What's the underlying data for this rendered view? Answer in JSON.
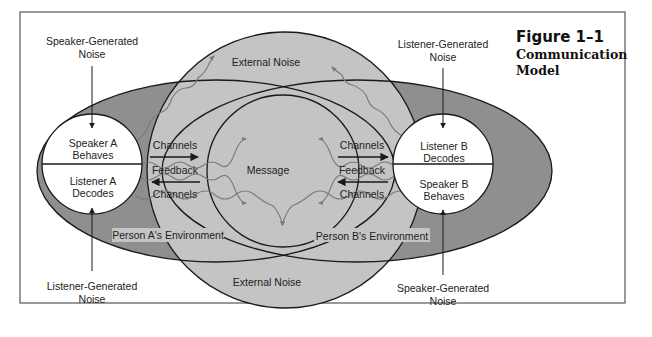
{
  "figure": {
    "number": "Figure 1–1",
    "title_line1": "Communication",
    "title_line2": "Model"
  },
  "colors": {
    "background": "#ffffff",
    "frame": "#555555",
    "environment_fill": "#8f8f8f",
    "external_noise_fill": "#c4c4c4",
    "person_circle_fill": "#ffffff",
    "stroke": "#1a1a1a",
    "wave": "#7a7a7a"
  },
  "noise_sources": {
    "top_left": {
      "line1": "Speaker-Generated",
      "line2": "Noise"
    },
    "top_right": {
      "line1": "Listener-Generated",
      "line2": "Noise"
    },
    "bottom_left": {
      "line1": "Listener-Generated",
      "line2": "Noise"
    },
    "bottom_right": {
      "line1": "Speaker-Generated",
      "line2": "Noise"
    }
  },
  "person_a": {
    "top": {
      "line1": "Speaker A",
      "line2": "Behaves"
    },
    "bottom": {
      "line1": "Listener A",
      "line2": "Decodes"
    },
    "environment": "Person A's Environment"
  },
  "person_b": {
    "top": {
      "line1": "Listener B",
      "line2": "Decodes"
    },
    "bottom": {
      "line1": "Speaker B",
      "line2": "Behaves"
    },
    "environment": "Person B's Environment"
  },
  "center": {
    "message": "Message",
    "external_noise_top": "External Noise",
    "external_noise_bottom": "External Noise"
  },
  "left_links": {
    "channels_top": "Channels",
    "feedback": "Feedback",
    "channels_bottom": "Channels"
  },
  "right_links": {
    "channels_top": "Channels",
    "feedback": "Feedback",
    "channels_bottom": "Channels"
  }
}
